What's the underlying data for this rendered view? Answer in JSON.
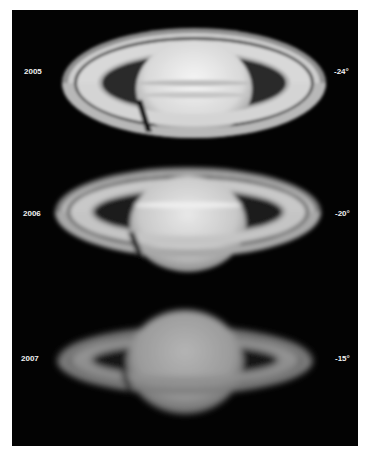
{
  "figure": {
    "background": "#030303",
    "rows": [
      {
        "year": "2005",
        "tilt": "-24°",
        "brightness": 1.0
      },
      {
        "year": "2006",
        "tilt": "-20°",
        "brightness": 0.92
      },
      {
        "year": "2007",
        "tilt": "-15°",
        "brightness": 0.72
      }
    ]
  }
}
